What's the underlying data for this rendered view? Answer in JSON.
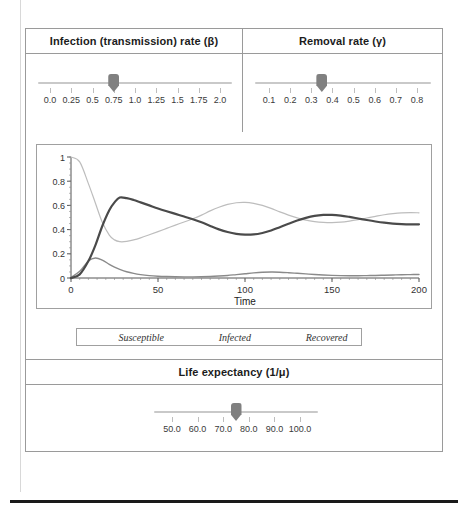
{
  "sliders": {
    "beta": {
      "title": "Infection (transmission) rate (β)",
      "ticks": [
        "0.0",
        "0.25",
        "0.5",
        "0.75",
        "1.0",
        "1.25",
        "1.5",
        "1.75",
        "2.0"
      ],
      "min": 0.0,
      "max": 2.0,
      "value": 0.75,
      "handle_name": "beta-slider-handle"
    },
    "gamma": {
      "title": "Removal rate (γ)",
      "ticks": [
        "0.1",
        "0.2",
        "0.3",
        "0.4",
        "0.5",
        "0.6",
        "0.7",
        "0.8"
      ],
      "min": 0.1,
      "max": 0.8,
      "value": 0.35,
      "handle_name": "gamma-slider-handle"
    },
    "life_expectancy": {
      "title": "Life expectancy (1/μ)",
      "ticks": [
        "50.0",
        "60.0",
        "70.0",
        "80.0",
        "90.0",
        "100.0"
      ],
      "min": 50.0,
      "max": 100.0,
      "value": 75.0,
      "handle_name": "life-expectancy-slider-handle"
    }
  },
  "colors": {
    "susceptible": "#bdbdbd",
    "infected": "#8a8a8a",
    "recovered": "#4a4a4a",
    "panel_border": "#9a9a9a",
    "axis": "#555555",
    "track": "#c9c9c9",
    "handle": "#808080"
  },
  "chart_data": {
    "type": "line",
    "title": "",
    "xlabel": "Time",
    "ylabel": "",
    "xlim": [
      0,
      200
    ],
    "ylim": [
      0,
      1
    ],
    "xticks": [
      0,
      50,
      100,
      150,
      200
    ],
    "xtick_labels": [
      "0",
      "50",
      "100",
      "150",
      "200"
    ],
    "yticks": [
      0,
      0.2,
      0.4,
      0.6,
      0.8,
      1
    ],
    "ytick_labels": [
      "0",
      "0.2",
      "0.4",
      "0.6",
      "0.8",
      "1"
    ],
    "grid": false,
    "legend_position": "below",
    "x": [
      0,
      5,
      10,
      14,
      18,
      22,
      25,
      28,
      32,
      36,
      40,
      45,
      50,
      55,
      60,
      65,
      70,
      75,
      80,
      85,
      90,
      95,
      100,
      105,
      110,
      115,
      120,
      125,
      130,
      135,
      140,
      145,
      150,
      155,
      160,
      165,
      170,
      175,
      180,
      185,
      190,
      195,
      200
    ],
    "series": [
      {
        "name": "Susceptible",
        "color": "#bdbdbd",
        "width": 1.2,
        "values": [
          1.0,
          0.96,
          0.78,
          0.62,
          0.46,
          0.355,
          0.315,
          0.3,
          0.302,
          0.315,
          0.332,
          0.357,
          0.383,
          0.41,
          0.437,
          0.463,
          0.49,
          0.52,
          0.555,
          0.585,
          0.608,
          0.622,
          0.625,
          0.617,
          0.6,
          0.575,
          0.546,
          0.52,
          0.497,
          0.478,
          0.466,
          0.459,
          0.457,
          0.461,
          0.47,
          0.482,
          0.496,
          0.51,
          0.523,
          0.532,
          0.538,
          0.54,
          0.539
        ]
      },
      {
        "name": "Infected",
        "color": "#8a8a8a",
        "width": 1.4,
        "values": [
          0.005,
          0.055,
          0.14,
          0.165,
          0.148,
          0.113,
          0.09,
          0.072,
          0.052,
          0.038,
          0.028,
          0.02,
          0.015,
          0.012,
          0.01,
          0.009,
          0.009,
          0.01,
          0.012,
          0.016,
          0.021,
          0.028,
          0.035,
          0.042,
          0.047,
          0.049,
          0.048,
          0.044,
          0.039,
          0.034,
          0.029,
          0.025,
          0.022,
          0.02,
          0.019,
          0.019,
          0.02,
          0.021,
          0.023,
          0.025,
          0.027,
          0.028,
          0.029
        ]
      },
      {
        "name": "Recovered",
        "color": "#4a4a4a",
        "width": 2.2,
        "values": [
          0.0,
          0.03,
          0.14,
          0.27,
          0.43,
          0.56,
          0.625,
          0.665,
          0.66,
          0.645,
          0.625,
          0.6,
          0.575,
          0.552,
          0.53,
          0.508,
          0.486,
          0.46,
          0.43,
          0.402,
          0.38,
          0.365,
          0.358,
          0.36,
          0.372,
          0.392,
          0.42,
          0.448,
          0.475,
          0.497,
          0.513,
          0.521,
          0.522,
          0.516,
          0.505,
          0.492,
          0.479,
          0.467,
          0.457,
          0.45,
          0.446,
          0.444,
          0.444
        ]
      }
    ],
    "legend": [
      "Susceptible",
      "Infected",
      "Recovered"
    ]
  }
}
